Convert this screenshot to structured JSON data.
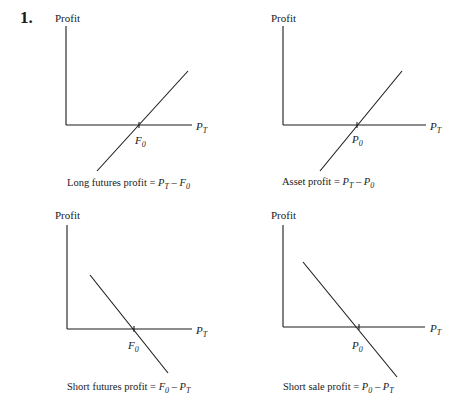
{
  "problem_number": "1.",
  "colors": {
    "ink": "#1a1a1a",
    "background": "#ffffff"
  },
  "panels": [
    {
      "id": "long-futures",
      "y_label": "Profit",
      "x_label": {
        "base": "P",
        "sub": "T"
      },
      "intercept_label": {
        "base": "F",
        "sub": "0"
      },
      "slope": "positive",
      "caption": {
        "prefix": "Long futures profit = ",
        "term1": {
          "base": "P",
          "sub": "T"
        },
        "op": " – ",
        "term2": {
          "base": "F",
          "sub": "0"
        }
      }
    },
    {
      "id": "asset",
      "y_label": "Profit",
      "x_label": {
        "base": "P",
        "sub": "T"
      },
      "intercept_label": {
        "base": "P",
        "sub": "0"
      },
      "slope": "positive",
      "caption": {
        "prefix": "Asset profit = ",
        "term1": {
          "base": "P",
          "sub": "T"
        },
        "op": " – ",
        "term2": {
          "base": "P",
          "sub": "0"
        }
      }
    },
    {
      "id": "short-futures",
      "y_label": "Profit",
      "x_label": {
        "base": "P",
        "sub": "T"
      },
      "intercept_label": {
        "base": "F",
        "sub": "0"
      },
      "slope": "negative",
      "caption": {
        "prefix": "Short futures profit = ",
        "term1": {
          "base": "F",
          "sub": "0"
        },
        "op": " – ",
        "term2": {
          "base": "P",
          "sub": "T"
        }
      }
    },
    {
      "id": "short-sale",
      "y_label": "Profit",
      "x_label": {
        "base": "P",
        "sub": "T"
      },
      "intercept_label": {
        "base": "P",
        "sub": "0"
      },
      "slope": "negative",
      "caption": {
        "prefix": "Short sale profit = ",
        "term1": {
          "base": "P",
          "sub": "0"
        },
        "op": " – ",
        "term2": {
          "base": "P",
          "sub": "T"
        }
      }
    }
  ]
}
